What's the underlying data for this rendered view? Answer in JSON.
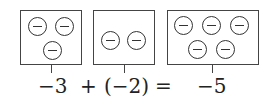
{
  "diagram": {
    "groups": [
      {
        "label": "-3",
        "counters": 3,
        "counter_sign": "negative"
      },
      {
        "label": "(-2)",
        "counters": 2,
        "counter_sign": "negative"
      },
      {
        "label": "-5",
        "counters": 5,
        "counter_sign": "negative"
      }
    ],
    "equation": {
      "term1": "−3",
      "op1": "+",
      "term2": "(−2)",
      "op2": "=",
      "result": "−5"
    }
  }
}
